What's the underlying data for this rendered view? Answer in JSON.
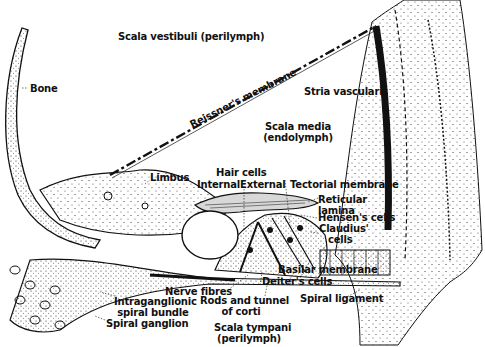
{
  "diagram": {
    "type": "anatomical cross-section",
    "labels": {
      "scala_vestibuli": "Scala vestibuli (perilymph)",
      "bone": "Bone",
      "reissners_membrane": "Reissner's membrane",
      "stria_vascularis": "Stria vascularis",
      "scala_media_1": "Scala media",
      "scala_media_2": "(endolymph)",
      "limbus": "Limbus",
      "hair_cells": "Hair cells",
      "internal": "Internal",
      "external": "External",
      "tectorial_membrane": "Tectorial membrane",
      "reticular_1": "Reticular",
      "reticular_2": "lamina",
      "hensens_cells": "Hensen's cells",
      "claudius_1": "Claudius'",
      "claudius_2": "cells",
      "basilar_membrane": "Basilar membrane",
      "deiters_cells": "Deiter's cells",
      "nerve_fibres": "Nerve fibres",
      "rods_1": "Rods and tunnel",
      "rods_2": "of corti",
      "spiral_ligament": "Spiral ligament",
      "intraganglionic_1": "Intraganglionic",
      "intraganglionic_2": "spiral bundle",
      "spiral_ganglion": "Spiral ganglion",
      "scala_tympani_1": "Scala tympani",
      "scala_tympani_2": "(perilymph)"
    },
    "colors": {
      "ink": "#111111",
      "background": "#ffffff"
    }
  }
}
